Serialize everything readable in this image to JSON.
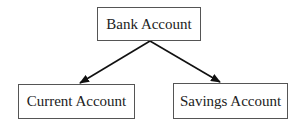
{
  "diagram": {
    "type": "hierarchy",
    "nodes": [
      {
        "id": "bank",
        "label": "Bank Account"
      },
      {
        "id": "current",
        "label": "Current Account"
      },
      {
        "id": "savings",
        "label": "Savings Account"
      }
    ],
    "edges": [
      {
        "from": "bank",
        "to": "current"
      },
      {
        "from": "bank",
        "to": "savings"
      }
    ]
  },
  "colors": {
    "stroke": "#111111",
    "border": "#555555",
    "text": "#222222"
  }
}
